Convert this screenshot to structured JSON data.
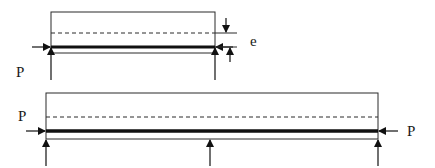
{
  "diagram": {
    "colors": {
      "stroke": "#2a2a2a",
      "tendon": "#111111",
      "background": "#ffffff"
    },
    "top_beam": {
      "description": "Simply supported beam with eccentric prestress force P",
      "force_label_left": "P",
      "eccentricity_label": "e",
      "supports": 2
    },
    "bottom_beam": {
      "description": "Two-span continuous beam with prestress force P at both ends",
      "force_label_left": "P",
      "force_label_right": "P",
      "supports": 3
    }
  }
}
